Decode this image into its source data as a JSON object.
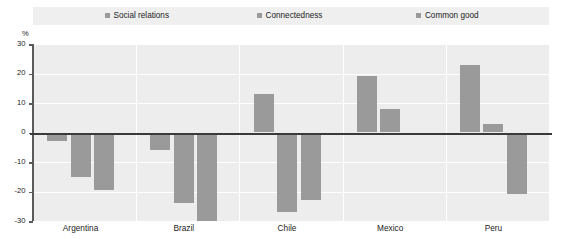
{
  "chart_data": {
    "type": "bar",
    "title": "",
    "subtitle": "",
    "xlabel": "",
    "ylabel": "%",
    "ylim": [
      -30,
      30
    ],
    "yticks": [
      30,
      20,
      10,
      0,
      -10,
      -20,
      -30
    ],
    "ytick_labels": [
      "30",
      "20",
      "10",
      "0",
      "-10",
      "-20",
      "-30"
    ],
    "grid": true,
    "legend_position": "top",
    "categories": [
      "Argentina",
      "Brazil",
      "Chile",
      "Mexico",
      "Peru"
    ],
    "series": [
      {
        "name": "Social relations",
        "color": "#9a9a9a",
        "values": [
          -3,
          -6,
          13,
          19,
          23
        ]
      },
      {
        "name": "Connectedness",
        "color": "#9a9a9a",
        "values": [
          -15,
          -24,
          -27,
          8,
          3
        ]
      },
      {
        "name": "Common good",
        "color": "#9a9a9a",
        "values": [
          -19.5,
          -31,
          -23,
          -1,
          -21
        ]
      }
    ]
  },
  "legend": {
    "items": [
      {
        "label": "Social relations",
        "color": "#9a9a9a"
      },
      {
        "label": "Connectedness",
        "color": "#9a9a9a"
      },
      {
        "label": "Common good",
        "color": "#9a9a9a"
      }
    ]
  },
  "axis": {
    "unit": "%"
  },
  "colors": {
    "bar": "#9a9a9a",
    "plot_background": "#ededed",
    "legend_background": "#efefef",
    "gridline": "#ffffff",
    "zero_line": "#3a3a3a",
    "axis_line": "#5a5a5a",
    "text": "#1c1c1c"
  }
}
